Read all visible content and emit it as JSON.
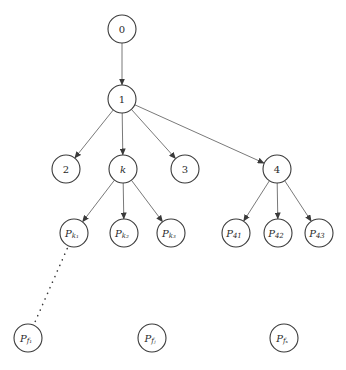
{
  "diagram": {
    "type": "tree",
    "node_radius": 14,
    "colors": {
      "stroke": "#3a3a3a",
      "edge": "#6a6a6a",
      "background": "#ffffff"
    },
    "nodes": [
      {
        "id": "n0",
        "label": "0",
        "x": 122,
        "y": 29
      },
      {
        "id": "n1",
        "label": "1",
        "x": 122,
        "y": 99
      },
      {
        "id": "n2",
        "label": "2",
        "x": 66,
        "y": 169
      },
      {
        "id": "nk",
        "label": "k",
        "italic": true,
        "x": 123,
        "y": 169
      },
      {
        "id": "n3",
        "label": "3",
        "x": 185,
        "y": 169
      },
      {
        "id": "n4",
        "label": "4",
        "x": 277,
        "y": 169
      },
      {
        "id": "pk1",
        "label": "P",
        "sub": "k₁",
        "x": 74,
        "y": 233
      },
      {
        "id": "pk2",
        "label": "P",
        "sub": "k₂",
        "x": 124,
        "y": 233
      },
      {
        "id": "pk3",
        "label": "P",
        "sub": "k₃",
        "x": 171,
        "y": 233
      },
      {
        "id": "p41",
        "label": "P",
        "sub": "41",
        "x": 236,
        "y": 233
      },
      {
        "id": "p42",
        "label": "P",
        "sub": "42",
        "x": 278,
        "y": 233
      },
      {
        "id": "p43",
        "label": "P",
        "sub": "43",
        "x": 319,
        "y": 233
      },
      {
        "id": "pf1",
        "label": "P",
        "sub": "f₁",
        "x": 28,
        "y": 338
      },
      {
        "id": "pfj",
        "label": "P",
        "sub": "fⱼ",
        "x": 152,
        "y": 338
      },
      {
        "id": "pfs",
        "label": "P",
        "sub": "fₛ",
        "x": 284,
        "y": 338
      }
    ],
    "edges": [
      {
        "from": "n0",
        "to": "n1",
        "style": "arrow"
      },
      {
        "from": "n1",
        "to": "n2",
        "style": "arrow"
      },
      {
        "from": "n1",
        "to": "nk",
        "style": "arrow"
      },
      {
        "from": "n1",
        "to": "n3",
        "style": "arrow"
      },
      {
        "from": "n1",
        "to": "n4",
        "style": "arrow"
      },
      {
        "from": "nk",
        "to": "pk1",
        "style": "arrow"
      },
      {
        "from": "nk",
        "to": "pk2",
        "style": "arrow"
      },
      {
        "from": "nk",
        "to": "pk3",
        "style": "arrow"
      },
      {
        "from": "n4",
        "to": "p41",
        "style": "arrow"
      },
      {
        "from": "n4",
        "to": "p42",
        "style": "arrow"
      },
      {
        "from": "n4",
        "to": "p43",
        "style": "arrow"
      },
      {
        "from": "pk1",
        "to": "pf1",
        "style": "dotted"
      }
    ]
  }
}
